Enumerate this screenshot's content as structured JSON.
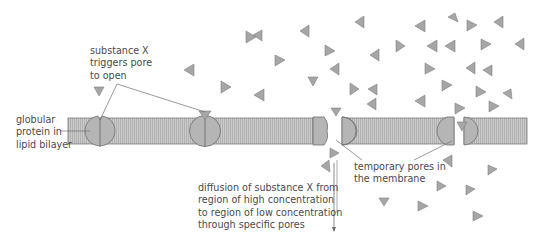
{
  "labels": {
    "substance_x": "substance X\ntriggers pore\nto open",
    "globular_protein": "globular\nprotein in\nlipid bilayer",
    "temporary_pores": "temporary pores in\nthe membrane",
    "diffusion": "diffusion of substance X from\nregion of high concentration\nto region of low concentration\nthrough specific pores"
  },
  "colors": {
    "membrane_fill": "#c4c4c4",
    "membrane_stripe": "#a8a8a8",
    "protein_fill": "#b5b5b5",
    "particle_fill": "#a6a6a6",
    "outline": "#6e6e6e",
    "text": "#4a4a4a"
  }
}
